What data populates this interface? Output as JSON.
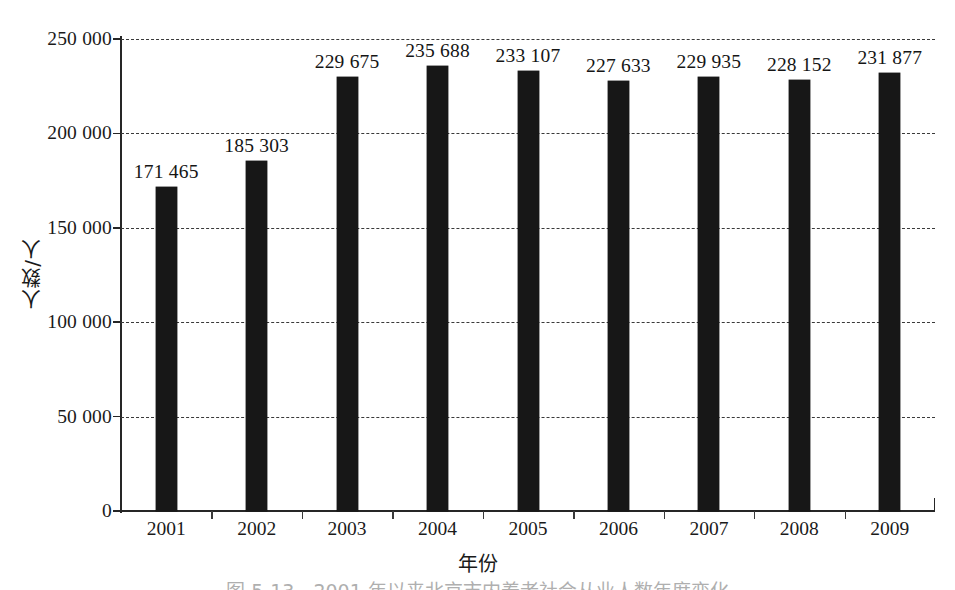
{
  "chart_data": {
    "type": "bar",
    "title": "",
    "subtitle": "",
    "categories": [
      "2001",
      "2002",
      "2003",
      "2004",
      "2005",
      "2006",
      "2007",
      "2008",
      "2009"
    ],
    "values": [
      171465,
      185303,
      229675,
      235688,
      233107,
      227633,
      229935,
      228152,
      231877
    ],
    "value_labels": [
      "171 465",
      "185 303",
      "229 675",
      "235 688",
      "233 107",
      "227 633",
      "229 935",
      "228 152",
      "231 877"
    ],
    "xlabel": "年份",
    "ylabel": "人数/人",
    "ylim": [
      0,
      250000
    ],
    "yticks": [
      0,
      50000,
      100000,
      150000,
      200000,
      250000
    ],
    "ytick_labels": [
      "0",
      "50 000",
      "100 000",
      "150 000",
      "200 000",
      "250 000"
    ],
    "grid": true,
    "grid_axis": "y",
    "grid_style": "dashed",
    "legend": null,
    "legend_position": "none",
    "bar_color": "#171717",
    "series": [
      {
        "name": "人数/人",
        "values": [
          171465,
          185303,
          229675,
          235688,
          233107,
          227633,
          229935,
          228152,
          231877
        ]
      }
    ]
  },
  "caption": {
    "text": "图 5-13　2001 年以来北京市内养老社会从业人数年度变化"
  },
  "colors": {
    "background": "#ffffff",
    "bar": "#171717",
    "axis": "#262626",
    "grid": "#3a3a3a",
    "text": "#1a1a1a"
  }
}
